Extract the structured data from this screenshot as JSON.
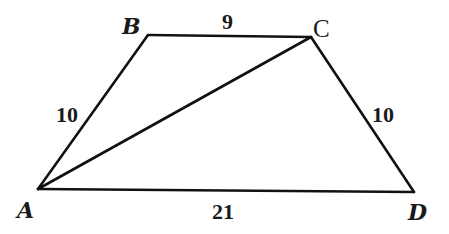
{
  "figure": {
    "type": "trapezoid-with-diagonal",
    "vertices": [
      {
        "id": "A",
        "label": "A",
        "x": 38,
        "y": 189,
        "label_x": 17,
        "label_y": 218
      },
      {
        "id": "B",
        "label": "B",
        "x": 148,
        "y": 35,
        "label_x": 122,
        "label_y": 34
      },
      {
        "id": "C",
        "label": "C",
        "x": 311,
        "y": 37,
        "label_x": 313,
        "label_y": 37
      },
      {
        "id": "D",
        "label": "D",
        "x": 414,
        "y": 192,
        "label_x": 408,
        "label_y": 220
      }
    ],
    "edges": [
      {
        "from": "A",
        "to": "B",
        "label": "10",
        "label_x": 56,
        "label_y": 122
      },
      {
        "from": "B",
        "to": "C",
        "label": "9",
        "label_x": 222,
        "label_y": 28
      },
      {
        "from": "C",
        "to": "D",
        "label": "10",
        "label_x": 372,
        "label_y": 122
      },
      {
        "from": "A",
        "to": "D",
        "label": "21",
        "label_x": 212,
        "label_y": 219
      },
      {
        "from": "A",
        "to": "C",
        "label": "",
        "label_x": 0,
        "label_y": 0
      }
    ]
  },
  "labels": {
    "A": "A",
    "B": "B",
    "C": "C",
    "D": "D",
    "AB": "10",
    "BC": "9",
    "CD": "10",
    "AD": "21"
  },
  "colors": {
    "stroke": "#111111",
    "text": "#1a1a1a",
    "background": "#ffffff"
  }
}
